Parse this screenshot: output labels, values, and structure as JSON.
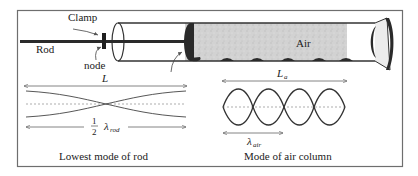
{
  "figure": {
    "labels": {
      "clamp": "Clamp",
      "rod": "Rod",
      "node": "node",
      "air": "Air",
      "rod_length": "L",
      "air_length_main": "L",
      "air_length_sub": "a",
      "half": "1",
      "half_den": "2",
      "lambda": "λ",
      "lambda_rod_sub": "rod",
      "lambda_air_sub": "air",
      "caption_rod": "Lowest mode of rod",
      "caption_air": "Mode of air column"
    },
    "colors": {
      "frame": "#6e6e6e",
      "rod": "#2a2a2a",
      "air_fill": "#cfcfcf",
      "dark": "#2b2b2b",
      "guide": "#8a8a8a"
    }
  }
}
